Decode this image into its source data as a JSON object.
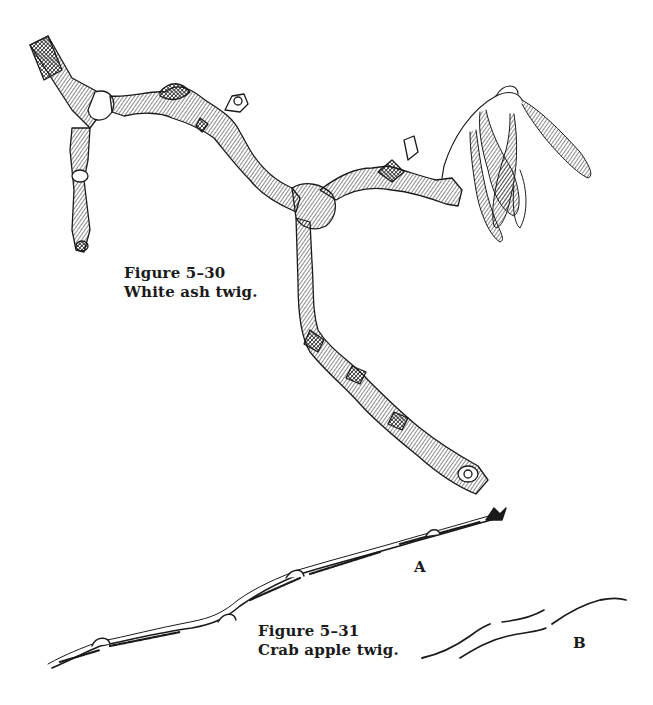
{
  "figures": [
    {
      "number": "Figure 5–30",
      "caption": "White ash twig.",
      "illustration": "white-ash-twig-drawing"
    },
    {
      "number": "Figure 5–31",
      "caption": "Crab apple twig.",
      "illustration": "crab-apple-twig-drawing",
      "labels": {
        "a": "A",
        "b": "B"
      }
    }
  ],
  "colors": {
    "ink": "#1a1a1a",
    "paper": "#ffffff"
  }
}
